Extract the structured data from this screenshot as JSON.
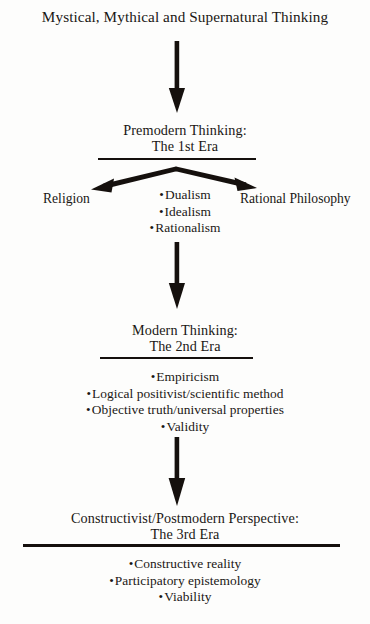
{
  "diagram": {
    "title": "Mystical, Mythical and Supernatural Thinking",
    "ink_color": "#15100d",
    "background_color": "#fdfdfc",
    "eras": [
      {
        "id": "era1",
        "heading_line1": "Premodern Thinking:",
        "heading_line2": "The 1st Era",
        "bullets": [
          "Dualism",
          "Idealism",
          "Rationalism"
        ],
        "branches": {
          "left_label": "Religion",
          "right_label": "Rational Philosophy"
        }
      },
      {
        "id": "era2",
        "heading_line1": "Modern Thinking:",
        "heading_line2": "The 2nd Era",
        "bullets": [
          "Empiricism",
          "Logical positivist/scientific method",
          "Objective truth/universal properties",
          "Validity"
        ]
      },
      {
        "id": "era3",
        "heading_line1": "Constructivist/Postmodern Perspective:",
        "heading_line2": "The 3rd Era",
        "bullets": [
          "Constructive reality",
          "Participatory epistemology",
          "Viability"
        ]
      }
    ],
    "connectors": [
      {
        "name": "arrow-title-to-era1",
        "type": "down-arrow"
      },
      {
        "name": "arrow-era1-to-era2",
        "type": "down-arrow"
      },
      {
        "name": "arrow-era2-to-era3",
        "type": "down-arrow"
      },
      {
        "name": "branch-era1-left",
        "type": "diagonal-arrow"
      },
      {
        "name": "branch-era1-right",
        "type": "diagonal-arrow"
      }
    ]
  }
}
